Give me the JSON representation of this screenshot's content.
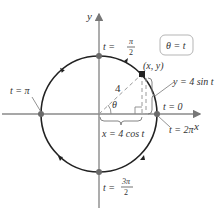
{
  "diagram": {
    "title_box": "θ = t",
    "axes": {
      "x_label": "x",
      "y_label": "y"
    },
    "circle": {
      "radius_label": "4",
      "angle_label": "θ",
      "point_label": "(x, y)"
    },
    "labels": {
      "t_pi_over_2": {
        "prefix": "t = ",
        "num": "π",
        "den": "2"
      },
      "t_pi": "t = π",
      "t_zero": "t = 0",
      "t_two_pi": "t = 2π",
      "t_3pi_over_2": {
        "prefix": "t = ",
        "num": "3π",
        "den": "2"
      },
      "x_eq": "x = 4 cos t",
      "y_eq": "y = 4 sin t"
    },
    "colors": {
      "curve": "#222222",
      "axis": "#8a8a8a",
      "point": "#6b6b6b",
      "dashed": "#9a9a9a",
      "box_border": "#b5b5b5"
    }
  }
}
